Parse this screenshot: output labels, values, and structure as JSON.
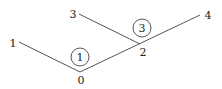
{
  "diagram": {
    "vertices": [
      {
        "id": "0",
        "label": "0",
        "x": 80,
        "y": 72,
        "lx": 81,
        "ly": 84
      },
      {
        "id": "1",
        "label": "1",
        "x": 19,
        "y": 42,
        "lx": 13,
        "ly": 47
      },
      {
        "id": "2",
        "label": "2",
        "x": 140,
        "y": 44,
        "lx": 143,
        "ly": 56
      },
      {
        "id": "3",
        "label": "3",
        "x": 79,
        "y": 14,
        "lx": 73,
        "ly": 18
      },
      {
        "id": "4",
        "label": "4",
        "x": 200,
        "y": 15,
        "lx": 208,
        "ly": 19
      }
    ],
    "edges": [
      {
        "from": "1",
        "to": "0"
      },
      {
        "from": "0",
        "to": "4"
      },
      {
        "from": "3",
        "to": "2"
      }
    ],
    "circled_labels": [
      {
        "label": "1",
        "cx": 80,
        "cy": 57,
        "r": 9
      },
      {
        "label": "3",
        "cx": 142,
        "cy": 28,
        "r": 9
      }
    ]
  }
}
